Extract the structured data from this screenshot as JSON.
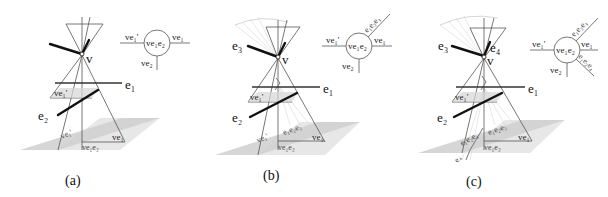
{
  "figure": {
    "panels": [
      {
        "id": "a",
        "caption": "(a)",
        "vertex_label": "v",
        "edge_labels": {
          "e1": "e₁",
          "e2": "e₂"
        },
        "plane_labels": {
          "ve1prime": "ve₁'",
          "ve1prime_low": "ve₁'",
          "ve1": "ve₁",
          "ve1e2": "ve₁e₂"
        },
        "node_diagram": {
          "center": "ve₁e₂",
          "left": "ve₁'",
          "right": "ve₁",
          "bottom": "ve₂"
        }
      },
      {
        "id": "b",
        "caption": "(b)",
        "vertex_label": "v",
        "edge_labels": {
          "e3": "e₃",
          "e1": "e₁",
          "e2": "e₂"
        },
        "plane_labels": {
          "ve1prime": "ve₁'",
          "ve1prime_low": "ve₁'",
          "ve1": "ve₁",
          "ve1e2": "ve₁e₂",
          "e1e2e3": "e₁e₂e₃"
        },
        "node_diagram": {
          "center": "ve₁e₂",
          "left": "ve₁'",
          "right": "ve₁",
          "bottom": "ve₂",
          "upper_right": "e₁e₂e₃"
        }
      },
      {
        "id": "c",
        "caption": "(c)",
        "vertex_label": "v",
        "edge_labels": {
          "e3": "e₃",
          "e4": "e₄",
          "e1": "e₁",
          "e2": "e₂"
        },
        "plane_labels": {
          "ve1prime": "ve₁'",
          "ve1": "ve₁",
          "ve1e2": "ve₁e₂",
          "e1e2e3": "e₁e₂e₃",
          "e1e2e4": "e₁e₂e₄",
          "e4": "e₄"
        },
        "node_diagram": {
          "center": "ve₁e₂",
          "left": "ve₁'",
          "right": "ve₁",
          "bottom": "ve₂",
          "upper_right": "e₁e₂e₃",
          "lower_right": "e₁e₂e₄"
        }
      }
    ]
  }
}
